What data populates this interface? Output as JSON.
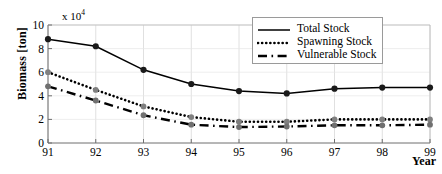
{
  "chart_data": {
    "type": "line",
    "title": "",
    "xlabel": "Year",
    "ylabel": "Biomass [ton]",
    "y_multiplier": "x 10",
    "y_multiplier_exponent": "4",
    "categories": [
      "91",
      "92",
      "93",
      "94",
      "95",
      "96",
      "97",
      "98",
      "99"
    ],
    "x": [
      91,
      92,
      93,
      94,
      95,
      96,
      97,
      98,
      99
    ],
    "xlim": [
      91,
      99
    ],
    "ylim": [
      0,
      10
    ],
    "yticks": [
      "0",
      "2",
      "4",
      "6",
      "8",
      "10"
    ],
    "ytick_values": [
      0,
      2,
      4,
      6,
      8,
      10
    ],
    "grid": true,
    "legend_position": "top-right",
    "series": [
      {
        "name": "Total Stock",
        "style": "solid",
        "color": "#000000",
        "marker": "circle",
        "marker_color": "#1a1a1a",
        "values": [
          8.8,
          8.2,
          6.2,
          5.0,
          4.4,
          4.2,
          4.6,
          4.7,
          4.7
        ]
      },
      {
        "name": "Spawning Stock",
        "style": "dotted",
        "color": "#000000",
        "marker": "circle",
        "marker_color": "#808080",
        "values": [
          6.0,
          4.5,
          3.1,
          2.2,
          1.8,
          1.8,
          2.0,
          2.0,
          2.0
        ]
      },
      {
        "name": "Vulnerable Stock",
        "style": "dashed",
        "color": "#000000",
        "marker": "circle",
        "marker_color": "#707070",
        "values": [
          4.8,
          3.6,
          2.35,
          1.55,
          1.35,
          1.4,
          1.5,
          1.5,
          1.55
        ]
      }
    ]
  },
  "legend": {
    "items": [
      {
        "label": "Total Stock"
      },
      {
        "label": "Spawning Stock"
      },
      {
        "label": "Vulnerable Stock"
      }
    ]
  }
}
